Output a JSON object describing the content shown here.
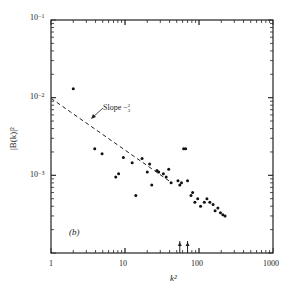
{
  "chart_data": {
    "type": "scatter",
    "title": "",
    "panel_label": "(b)",
    "xlabel": "k²",
    "ylabel": "|B(k)|²",
    "xscale": "log",
    "yscale": "log",
    "xlim": [
      1,
      1000
    ],
    "ylim": [
      0.0001,
      0.1
    ],
    "x_ticks": [
      "1",
      "10",
      "100",
      "1000"
    ],
    "y_ticks": [
      {
        "base": "10",
        "exp": "−1"
      },
      {
        "base": "10",
        "exp": "−2"
      },
      {
        "base": "10",
        "exp": "−3"
      }
    ],
    "grid": false,
    "legend": null,
    "annotation": {
      "text": "Slope −2/3",
      "display": "Slope −",
      "frac_num": "2",
      "frac_den": "3"
    },
    "reference_line": {
      "style": "dashed",
      "slope": -0.6667,
      "x": [
        1,
        40
      ],
      "y": [
        0.0098,
        0.00084
      ]
    },
    "axis_markers": {
      "type": "arrow-up",
      "x": [
        55,
        70
      ]
    },
    "series": [
      {
        "name": "|B(k)|²",
        "points": [
          [
            2.0,
            0.013
          ],
          [
            3.9,
            0.0022
          ],
          [
            4.9,
            0.0019
          ],
          [
            7.5,
            0.00095
          ],
          [
            8.2,
            0.00105
          ],
          [
            9.5,
            0.0017
          ],
          [
            12.5,
            0.00145
          ],
          [
            14.0,
            0.00055
          ],
          [
            17.0,
            0.00165
          ],
          [
            20.0,
            0.0011
          ],
          [
            21.5,
            0.0014
          ],
          [
            23.0,
            0.00075
          ],
          [
            27.0,
            0.00115
          ],
          [
            28.5,
            0.0011
          ],
          [
            33.0,
            0.00105
          ],
          [
            36.0,
            0.00095
          ],
          [
            39.0,
            0.0012
          ],
          [
            42.0,
            0.0008
          ],
          [
            52.0,
            0.00085
          ],
          [
            55.0,
            0.00075
          ],
          [
            58.0,
            0.0008
          ],
          [
            62.0,
            0.0022
          ],
          [
            66.0,
            0.0022
          ],
          [
            70.0,
            0.00085
          ],
          [
            78.0,
            0.00055
          ],
          [
            82.0,
            0.0006
          ],
          [
            88.0,
            0.00045
          ],
          [
            96.0,
            0.0005
          ],
          [
            105.0,
            0.0004
          ],
          [
            118.0,
            0.00045
          ],
          [
            128.0,
            0.0005
          ],
          [
            140.0,
            0.00045
          ],
          [
            155.0,
            0.00042
          ],
          [
            165.0,
            0.00035
          ],
          [
            180.0,
            0.00038
          ],
          [
            195.0,
            0.00033
          ],
          [
            210.0,
            0.00031
          ],
          [
            225.0,
            0.0003
          ]
        ]
      }
    ]
  }
}
